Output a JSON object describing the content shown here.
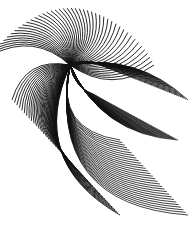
{
  "image": {
    "description": "Abstract black string-art curves fanning from a focal point on white background",
    "width": 193,
    "height": 227,
    "background": "#ffffff",
    "stroke": "#111111"
  },
  "art": {
    "focus": [
      70,
      65
    ],
    "fans": [
      {
        "name": "top-fan",
        "count": 45,
        "from_angle": 190,
        "to_angle": 360,
        "radius": 60,
        "bend": 0.35,
        "width": 0.9
      },
      {
        "name": "right-upper-band",
        "count": 40,
        "target_start": [
          100,
          65
        ],
        "target_end": [
          188,
          100
        ],
        "bend": -0.25,
        "width": 0.8
      },
      {
        "name": "right-dense-band",
        "count": 55,
        "target_start": [
          95,
          95
        ],
        "target_end": [
          178,
          140
        ],
        "bend": 0.3,
        "width": 0.7
      },
      {
        "name": "left-lower-fan",
        "count": 45,
        "target_start": [
          12,
          100
        ],
        "target_end": [
          120,
          215
        ],
        "bend": 0.45,
        "width": 0.9
      },
      {
        "name": "bottom-right-fan",
        "count": 30,
        "target_start": [
          120,
          140
        ],
        "target_end": [
          188,
          215
        ],
        "bend": 0.55,
        "width": 0.8
      }
    ]
  }
}
